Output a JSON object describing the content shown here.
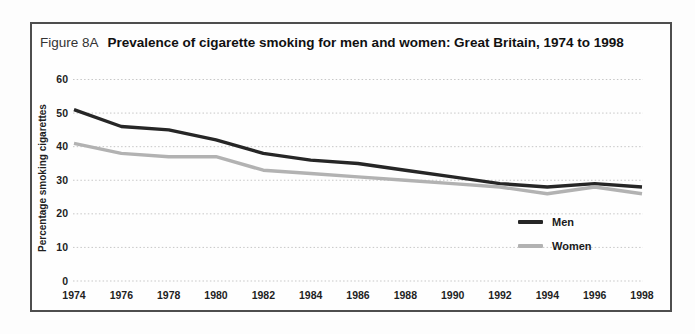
{
  "figure": {
    "label": "Figure 8A",
    "title": "Prevalence of cigarette smoking for men and women:  Great Britain, 1974 to 1998"
  },
  "chart_data": {
    "type": "line",
    "categories": [
      "1974",
      "1976",
      "1978",
      "1980",
      "1982",
      "1984",
      "1986",
      "1988",
      "1990",
      "1992",
      "1994",
      "1996",
      "1998"
    ],
    "series": [
      {
        "name": "Men",
        "color": "#262626",
        "values": [
          51,
          46,
          45,
          42,
          38,
          36,
          35,
          33,
          31,
          29,
          28,
          29,
          28
        ]
      },
      {
        "name": "Women",
        "color": "#b2b2b2",
        "values": [
          41,
          38,
          37,
          37,
          33,
          32,
          31,
          30,
          29,
          28,
          26,
          28,
          26
        ]
      }
    ],
    "title": "Prevalence of cigarette smoking for men and women:  Great Britain, 1974 to 1998",
    "xlabel": "",
    "ylabel": "Percentage smoking cigarettes",
    "ylim": [
      0,
      60
    ],
    "yticks": [
      0,
      10,
      20,
      30,
      40,
      50,
      60
    ],
    "grid": true,
    "gridline_color": "#c7c7c7",
    "legend_position": "inside-right"
  }
}
